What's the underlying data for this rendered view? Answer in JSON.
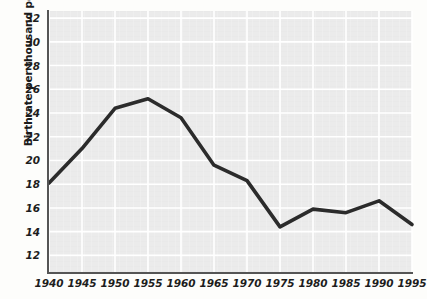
{
  "chart_data": {
    "type": "line",
    "title": "",
    "subtitle": "",
    "xlabel": "",
    "ylabel": "Birthrate per thousand population",
    "x": [
      1940,
      1945,
      1950,
      1955,
      1960,
      1965,
      1970,
      1975,
      1980,
      1985,
      1990,
      1995
    ],
    "xtick_labels": [
      "1940",
      "1945",
      "1950",
      "1955",
      "1960",
      "1965",
      "1970",
      "1975",
      "1980",
      "1985",
      "1990",
      "1995"
    ],
    "values": [
      18.1,
      21.0,
      24.4,
      25.2,
      23.6,
      19.6,
      18.3,
      14.4,
      15.9,
      15.6,
      16.6,
      14.6
    ],
    "series": [
      {
        "name": "Birthrate per thousand population",
        "values": [
          18.1,
          21.0,
          24.4,
          25.2,
          23.6,
          19.6,
          18.3,
          14.4,
          15.9,
          15.6,
          16.6,
          14.6
        ]
      }
    ],
    "ytick_labels": [
      "32",
      "30",
      "28",
      "26",
      "24",
      "22",
      "20",
      "18",
      "16",
      "14",
      "12"
    ],
    "yticks": [
      32,
      30,
      28,
      26,
      24,
      22,
      20,
      18,
      16,
      14,
      12
    ],
    "ylim": [
      10.6,
      32.6
    ],
    "xlim": [
      1940,
      1995
    ],
    "grid": true,
    "legend": false,
    "line_color": "#2b2b2b",
    "grid_color": "#ffffff",
    "plot_background": "#ebebeb",
    "page_background": "#fdfdfb"
  }
}
